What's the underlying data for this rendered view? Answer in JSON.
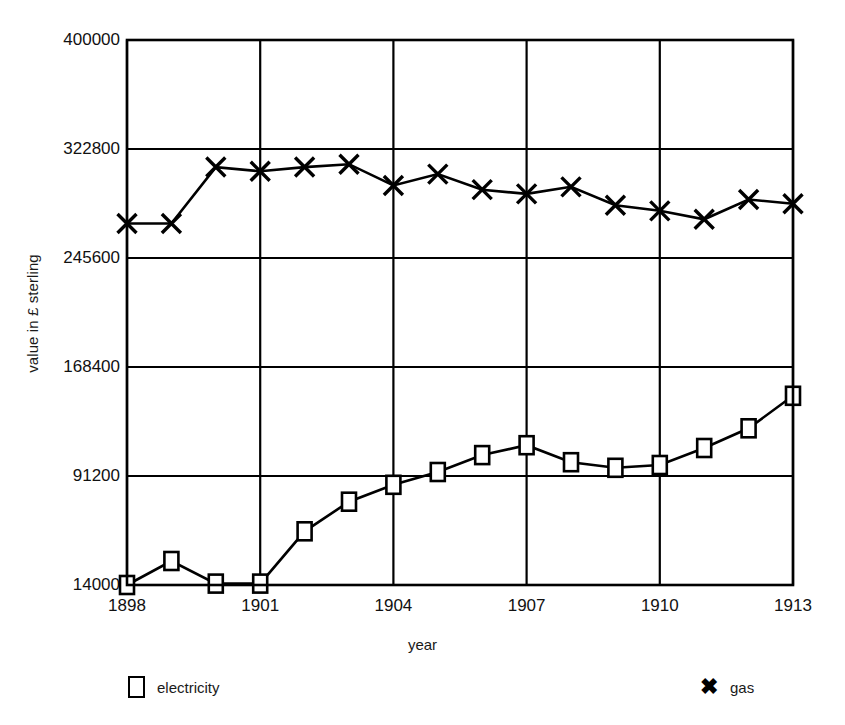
{
  "chart_data": {
    "type": "line",
    "title": "",
    "xlabel": "year",
    "ylabel": "value in £ sterling",
    "x": [
      1898,
      1899,
      1900,
      1901,
      1902,
      1903,
      1904,
      1905,
      1906,
      1907,
      1908,
      1909,
      1910,
      1911,
      1912,
      1913
    ],
    "xtick_labels": [
      "1898",
      "1901",
      "1904",
      "1907",
      "1910",
      "1913"
    ],
    "xtick_values": [
      1898,
      1901,
      1904,
      1907,
      1910,
      1913
    ],
    "ytick_labels": [
      "14000",
      "91200",
      "168400",
      "245600",
      "322800",
      "400000"
    ],
    "ytick_values": [
      14000,
      91200,
      168400,
      245600,
      322800,
      400000
    ],
    "ylim": [
      14000,
      400000
    ],
    "xlim": [
      1898,
      1913
    ],
    "grid": true,
    "legend_position": "below",
    "series": [
      {
        "name": "electricity",
        "marker": "square",
        "color": "#000000",
        "values": [
          14000,
          31000,
          15000,
          15000,
          52000,
          73000,
          85000,
          94000,
          106000,
          113000,
          101000,
          97000,
          99000,
          111000,
          125000,
          148000
        ]
      },
      {
        "name": "gas",
        "marker": "x",
        "color": "#000000",
        "values": [
          270000,
          270000,
          310000,
          307000,
          310000,
          312000,
          297000,
          305000,
          294000,
          291000,
          296000,
          283000,
          279000,
          273000,
          287000,
          284000
        ]
      }
    ]
  },
  "axis": {
    "y_title": "value in £ sterling",
    "x_title": "year"
  },
  "legend": {
    "items": [
      {
        "label": "electricity",
        "marker": "square-marker-icon"
      },
      {
        "label": "gas",
        "marker": "x-marker-icon"
      }
    ]
  }
}
